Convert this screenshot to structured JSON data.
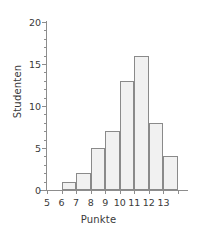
{
  "chart_data": {
    "type": "bar",
    "title": "",
    "xlabel": "Punkte",
    "ylabel": "Studenten",
    "categories": [
      "6",
      "7",
      "8",
      "9",
      "10",
      "11",
      "12",
      "13"
    ],
    "values": [
      1,
      2,
      5,
      7,
      13,
      16,
      8,
      4
    ],
    "bin_edges": [
      5,
      6,
      7,
      8,
      9,
      10,
      11,
      12,
      13,
      14
    ],
    "bin_values": [
      0,
      1,
      2,
      5,
      7,
      13,
      16,
      8,
      4
    ],
    "xlim": [
      5,
      14
    ],
    "ylim": [
      0,
      20
    ],
    "x_tick_labels": [
      "5",
      "6",
      "7",
      "8",
      "9",
      "10",
      "11",
      "12",
      "13"
    ],
    "x_tick_values": [
      5,
      6,
      7,
      8,
      9,
      10,
      11,
      12,
      13
    ],
    "y_tick_labels": [
      "0",
      "5",
      "10",
      "15",
      "20"
    ],
    "y_tick_values": [
      0,
      5,
      10,
      15,
      20
    ],
    "y_minor_ticks": [
      1,
      2,
      3,
      4,
      6,
      7,
      8,
      9,
      11,
      12,
      13,
      14,
      16,
      17,
      18,
      19
    ],
    "grid": false,
    "legend": null,
    "bar_fill_color": "#f1f1f1",
    "bar_border_color": "#8a8a8a",
    "axis_color": "#8d8d8d",
    "text_color": "#3a3a3a",
    "background_color": "#ffffff"
  }
}
